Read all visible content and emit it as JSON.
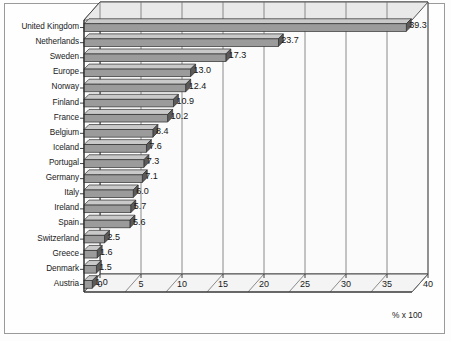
{
  "chart_data": {
    "type": "bar",
    "orientation": "horizontal",
    "title": "",
    "subtitle": "",
    "xlabel": "% x 100",
    "ylabel": "",
    "xlim": [
      0,
      40
    ],
    "xticks": [
      0,
      5,
      10,
      15,
      20,
      25,
      30,
      35,
      40
    ],
    "grid": true,
    "grid_axis": "x",
    "legend": false,
    "legend_position": "none",
    "style_3d": true,
    "categories": [
      "United Kingdom",
      "Netherlands",
      "Sweden",
      "Europe",
      "Norway",
      "Finland",
      "France",
      "Belgium",
      "Iceland",
      "Portugal",
      "Germany",
      "Italy",
      "Ireland",
      "Spain",
      "Switzerland",
      "Greece",
      "Denmark",
      "Austria"
    ],
    "values": [
      39.3,
      23.7,
      17.3,
      13.0,
      12.4,
      10.9,
      10.2,
      8.4,
      7.6,
      7.3,
      7.1,
      6.0,
      5.7,
      5.6,
      2.5,
      1.6,
      1.5,
      1.0
    ],
    "data_labels": [
      "39.3",
      "23.7",
      "17.3",
      "13.0",
      "12.4",
      "10.9",
      "10.2",
      "8.4",
      "7.6",
      "7.3",
      "7.1",
      "6.0",
      "5.7",
      "5.6",
      "2.5",
      "1.6",
      "1.5",
      "1.0"
    ],
    "tick_labels": [
      "0",
      "5",
      "10",
      "15",
      "20",
      "25",
      "30",
      "35",
      "40"
    ],
    "colors": {
      "bar_face": "#9b9b9b",
      "bar_top": "#c9c9c9",
      "bar_side": "#5a5a5a",
      "bar_outline": "#2e2e2e",
      "plot_background": "#fefefe",
      "wall_background": "#fbfbfb",
      "floor_background": "#f4f4f4",
      "gridline": "#6f6f6f",
      "axis": "#2b2b2b",
      "frame": "#9a9a9a",
      "text": "#1a1a1a"
    }
  }
}
